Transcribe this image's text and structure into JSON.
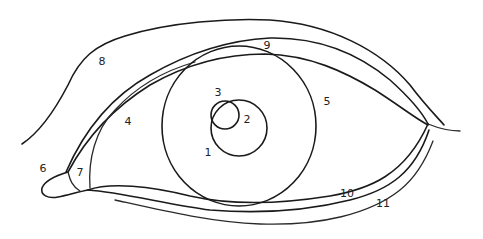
{
  "diagram": {
    "type": "eye-anatomy-line-drawing",
    "stroke_color": "#1a1a1a",
    "background": "#ffffff",
    "labels": [
      {
        "id": "1",
        "text": "1",
        "x": 208,
        "y": 152
      },
      {
        "id": "2",
        "text": "2",
        "x": 247,
        "y": 119
      },
      {
        "id": "3",
        "text": "3",
        "x": 218,
        "y": 92
      },
      {
        "id": "4",
        "text": "4",
        "x": 128,
        "y": 121
      },
      {
        "id": "5",
        "text": "5",
        "x": 327,
        "y": 101
      },
      {
        "id": "6",
        "text": "6",
        "x": 43,
        "y": 168
      },
      {
        "id": "7",
        "text": "7",
        "x": 80,
        "y": 172
      },
      {
        "id": "8",
        "text": "8",
        "x": 102,
        "y": 61
      },
      {
        "id": "9",
        "text": "9",
        "x": 267,
        "y": 45
      },
      {
        "id": "10",
        "text": "10",
        "x": 347,
        "y": 193
      },
      {
        "id": "11",
        "text": "11",
        "x": 383,
        "y": 203
      }
    ]
  }
}
